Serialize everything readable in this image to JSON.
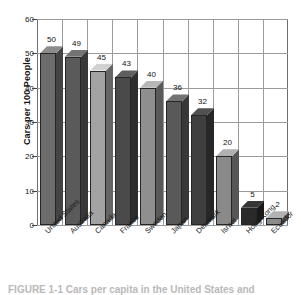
{
  "chart_data": {
    "type": "bar",
    "title": "",
    "subtitle": "",
    "xlabel": "",
    "ylabel": "Cars per 100 People",
    "ylim": [
      0,
      60
    ],
    "ytick_step": 10,
    "yticks": [
      "60",
      "50",
      "40",
      "30",
      "20",
      "10",
      "0"
    ],
    "grid": "both",
    "legend": "none",
    "style_3d": true,
    "categories": [
      "United States",
      "Australia",
      "Canada",
      "France",
      "Sweden",
      "Japan",
      "Denmark",
      "Israel",
      "Hong Kong",
      "Ecuador"
    ],
    "values": [
      50,
      49,
      45,
      43,
      40,
      36,
      32,
      20,
      5,
      2
    ],
    "value_labels": [
      "50",
      "49",
      "45",
      "43",
      "40",
      "36",
      "32",
      "20",
      "5",
      "2"
    ],
    "bar_colors": [
      "#6d6d6d",
      "#5a5a5a",
      "#a3a3a3",
      "#4a4a4a",
      "#8f8f8f",
      "#595959",
      "#3f3f3f",
      "#8a8a8a",
      "#2a2a2a",
      "#8b8b8b"
    ]
  },
  "caption": {
    "text": "FIGURE 1-1 Cars per capita in the United States and"
  },
  "colors": {
    "grid": "#9b9b9b",
    "axis": "#6e6e6e",
    "text": "#141414",
    "background": "#ffffff"
  }
}
